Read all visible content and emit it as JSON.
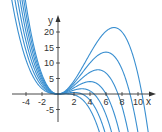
{
  "chart_data": {
    "type": "line",
    "title": "",
    "xlabel": "x",
    "ylabel": "y",
    "xlim": [
      -5.5,
      12.5
    ],
    "ylim": [
      -8,
      26
    ],
    "grid": false,
    "x_ticks": [
      -4,
      -2,
      2,
      4,
      6,
      8,
      10
    ],
    "y_ticks": [
      -5,
      5,
      10,
      15,
      20
    ],
    "x_tick_labels": [
      "-4",
      "-2",
      "2",
      "4",
      "6",
      "8",
      "10"
    ],
    "y_tick_labels": [
      "-5",
      "5",
      "10",
      "15",
      "20"
    ],
    "curve_color": "#3a8fd0",
    "formula": "y = x^2 (r - x) / 8",
    "series": [
      {
        "name": "r=1.5",
        "root": 1.5,
        "max_x": 1.0,
        "max_y": 0.06
      },
      {
        "name": "r=3",
        "root": 3.0,
        "max_x": 2.0,
        "max_y": 0.5
      },
      {
        "name": "r=4.5",
        "root": 4.5,
        "max_x": 3.0,
        "max_y": 1.69
      },
      {
        "name": "r=6",
        "root": 6.0,
        "max_x": 4.0,
        "max_y": 4.0
      },
      {
        "name": "r=7.5",
        "root": 7.5,
        "max_x": 5.0,
        "max_y": 7.81
      },
      {
        "name": "r=9",
        "root": 9.0,
        "max_x": 6.0,
        "max_y": 13.5
      },
      {
        "name": "r=10.5",
        "root": 10.5,
        "max_x": 7.0,
        "max_y": 21.44
      }
    ]
  }
}
